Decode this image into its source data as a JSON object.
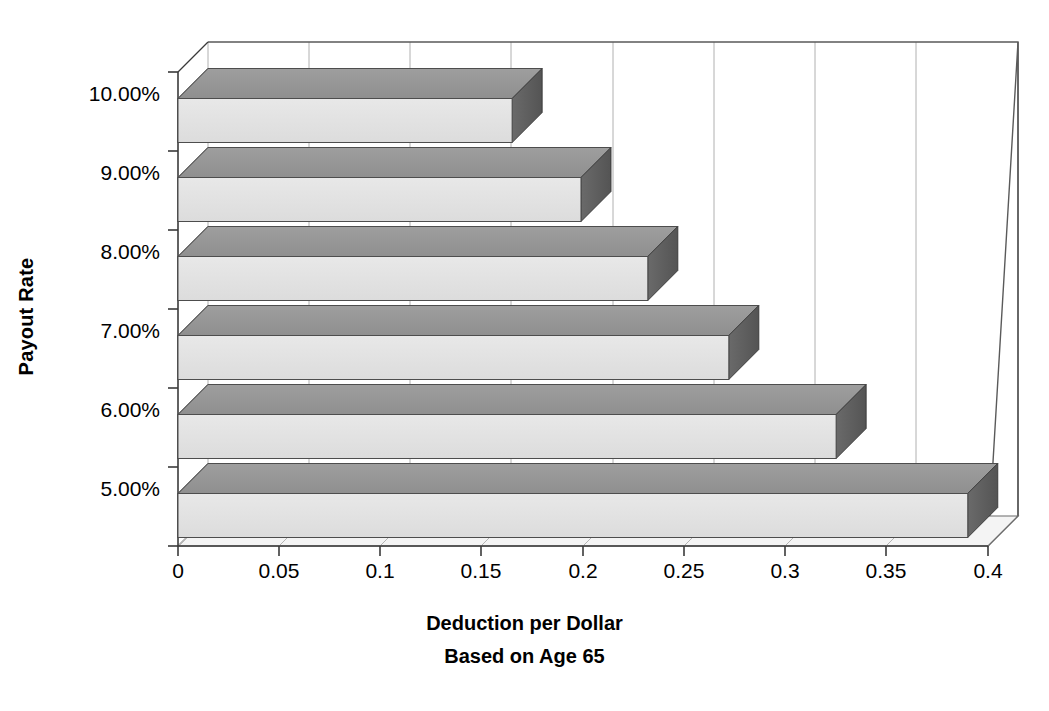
{
  "chart_data": {
    "type": "bar",
    "orientation": "horizontal",
    "style": "3d",
    "title": "",
    "subtitle": "",
    "xlabel": "Deduction per Dollar",
    "xlabel_line2": "Based on Age 65",
    "ylabel": "Payout Rate",
    "categories": [
      "5.00%",
      "6.00%",
      "7.00%",
      "8.00%",
      "9.00%",
      "10.00%"
    ],
    "values": [
      0.39,
      0.325,
      0.272,
      0.232,
      0.199,
      0.165
    ],
    "series": [
      {
        "name": "Deduction per Dollar",
        "values": [
          0.39,
          0.325,
          0.272,
          0.232,
          0.199,
          0.165
        ]
      }
    ],
    "xlim": [
      0,
      0.4
    ],
    "ylim": null,
    "xticks": [
      0,
      0.05,
      0.1,
      0.15,
      0.2,
      0.25,
      0.3,
      0.35,
      0.4
    ],
    "xticklabels": [
      "0",
      "0.05",
      "0.1",
      "0.15",
      "0.2",
      "0.25",
      "0.3",
      "0.35",
      "0.4"
    ],
    "yticklabels": [
      "5.00%",
      "6.00%",
      "7.00%",
      "8.00%",
      "9.00%",
      "10.00%"
    ],
    "grid": true,
    "grid_axis": "x",
    "legend": false,
    "legend_position": "none",
    "annotations": [],
    "colors": {
      "bar_front": "#e3e3e3",
      "bar_top": "#9a9a9a",
      "bar_side": "#5d5d5d",
      "grid": "#9a9a9a",
      "axis": "#3a3a3a",
      "floor": "#f2f2f2",
      "text": "#000000"
    }
  },
  "axes": {
    "y_title": "Payout Rate",
    "x_title_line1": "Deduction per Dollar",
    "x_title_line2": "Based on Age 65"
  }
}
